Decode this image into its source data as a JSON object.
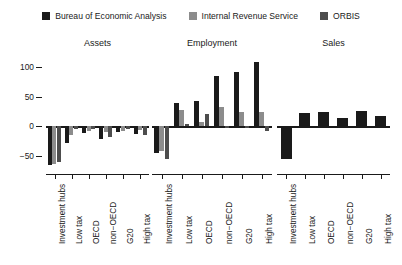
{
  "chart_data": {
    "type": "bar",
    "title": "",
    "subtitle": "",
    "xlabel": "",
    "ylabel": "",
    "ylim": [
      -70,
      115
    ],
    "yticks": [
      100,
      50,
      0,
      -50
    ],
    "ytick_labels": [
      "100",
      "50",
      "0",
      "−50"
    ],
    "grid": false,
    "legend_position": "top-center",
    "legend": [
      "Bureau of Economic Analysis",
      "Internal Revenue Service",
      "ORBIS"
    ],
    "series_colors": [
      "#1a1a1a",
      "#8c8c8c",
      "#4d4d4d"
    ],
    "categories": [
      "Investment hubs",
      "Low tax",
      "OECD",
      "non−OECD",
      "G20",
      "High tax"
    ],
    "panels": [
      {
        "title": "Assets",
        "series": [
          {
            "name": "Bureau of Economic Analysis",
            "values": [
              -65,
              -28,
              -11,
              -22,
              -10,
              -12
            ]
          },
          {
            "name": "Internal Revenue Service",
            "values": [
              -63,
              -15,
              -7,
              -9,
              -8,
              -6
            ]
          },
          {
            "name": "ORBIS",
            "values": [
              -60,
              -5,
              -4,
              -18,
              -5,
              -14
            ]
          }
        ]
      },
      {
        "title": "Employment",
        "series": [
          {
            "name": "Bureau of Economic Analysis",
            "values": [
              -45,
              40,
              43,
              84,
              92,
              108
            ]
          },
          {
            "name": "Internal Revenue Service",
            "values": [
              -42,
              27,
              8,
              32,
              24,
              25
            ]
          },
          {
            "name": "ORBIS",
            "values": [
              -55,
              4,
              20,
              -3,
              -3,
              -8
            ]
          }
        ]
      },
      {
        "title": "Sales",
        "series": [
          {
            "name": "Bureau of Economic Analysis",
            "values": [
              -55,
              22,
              24,
              14,
              26,
              18
            ]
          }
        ]
      }
    ]
  }
}
